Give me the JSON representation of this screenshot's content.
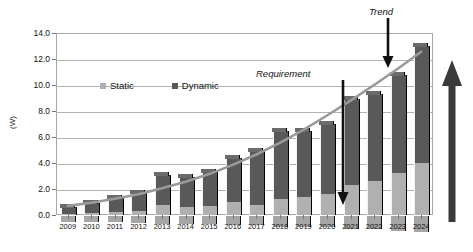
{
  "chart_data": {
    "type": "bar",
    "title": "",
    "subtitle": "",
    "xlabel": "",
    "ylabel": "(W)",
    "ylim": [
      0.0,
      14.0
    ],
    "ytick_labels": [
      "0.0",
      "2.0",
      "4.0",
      "6.0",
      "8.0",
      "10.0",
      "12.0",
      "14.0"
    ],
    "ytick_values": [
      0.0,
      2.0,
      4.0,
      6.0,
      8.0,
      10.0,
      12.0,
      14.0
    ],
    "grid": true,
    "stacked": true,
    "legend_position": "inside-top-left",
    "categories": [
      "2009",
      "2010",
      "2011",
      "2012",
      "2013",
      "2014",
      "2015",
      "2016",
      "2017",
      "2018",
      "2019",
      "2020",
      "2021",
      "2022",
      "2023",
      "2024"
    ],
    "series": [
      {
        "name": "Static",
        "color": "#b0b0b0",
        "values": [
          0.1,
          0.15,
          0.2,
          0.3,
          0.8,
          0.6,
          0.7,
          1.0,
          0.8,
          1.2,
          1.4,
          1.6,
          2.3,
          2.6,
          3.2,
          4.0
        ]
      },
      {
        "name": "Dynamic",
        "color": "#595959",
        "values": [
          0.5,
          0.75,
          1.1,
          1.4,
          2.3,
          2.3,
          2.6,
          3.4,
          4.1,
          5.3,
          5.1,
          5.4,
          6.6,
          6.7,
          7.6,
          9.0
        ]
      }
    ],
    "totals": [
      0.6,
      0.9,
      1.3,
      1.7,
      3.1,
      2.9,
      3.3,
      4.4,
      4.9,
      6.5,
      6.5,
      7.0,
      8.9,
      9.3,
      10.8,
      13.0
    ],
    "trend": {
      "name": "Trend",
      "color": "#9a9a9a",
      "x": [
        "2009",
        "2010",
        "2011",
        "2012",
        "2013",
        "2014",
        "2015",
        "2016",
        "2017",
        "2018",
        "2019",
        "2020",
        "2021",
        "2022",
        "2023",
        "2024"
      ],
      "values": [
        0.7,
        0.95,
        1.25,
        1.6,
        2.05,
        2.55,
        3.15,
        3.85,
        4.65,
        5.55,
        6.55,
        7.65,
        8.8,
        10.0,
        11.25,
        12.55
      ]
    },
    "annotations": [
      {
        "id": "trend-annotation",
        "label": "Trend",
        "points_to": "2022",
        "style": "italic-with-down-arrow"
      },
      {
        "id": "requirement-annotation",
        "label": "Requirement",
        "points_to": "2020",
        "style": "italic-with-down-arrow"
      },
      {
        "id": "growth-arrow",
        "label": "",
        "style": "up-arrow-right-margin"
      }
    ]
  },
  "legend": {
    "items": [
      {
        "label": "Static",
        "color": "#b0b0b0"
      },
      {
        "label": "Dynamic",
        "color": "#595959"
      }
    ]
  }
}
